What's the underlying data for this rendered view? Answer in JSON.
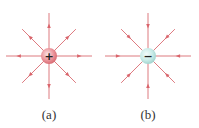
{
  "figure": {
    "panels": [
      {
        "id": "a",
        "label": "(a)",
        "charge_sign": "+",
        "charge_type": "positive",
        "field_direction": "outward",
        "field_line_count": 8,
        "charge_color": "#e98b92",
        "line_color": "#d9646b"
      },
      {
        "id": "b",
        "label": "(b)",
        "charge_sign": "−",
        "charge_type": "negative",
        "field_direction": "inward",
        "field_line_count": 8,
        "charge_color": "#bfe6e3",
        "line_color": "#d9646b"
      }
    ]
  }
}
